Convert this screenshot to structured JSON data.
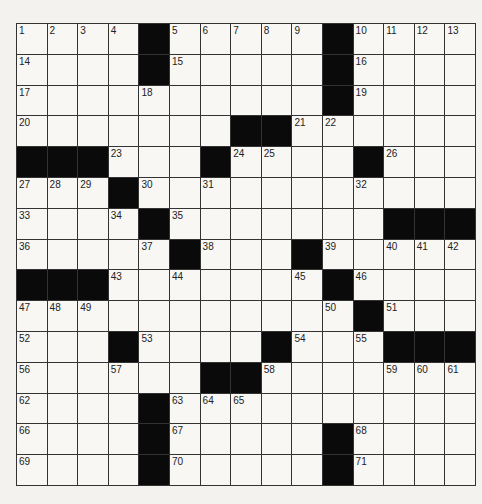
{
  "puzzle": {
    "rows": 15,
    "cols": 15,
    "colors": {
      "black": "#0a0a0a",
      "white": "#f8f7f4",
      "grid_line": "#333333"
    },
    "grid": [
      [
        "1",
        "2",
        "3",
        "4",
        "#",
        "5",
        "6",
        "7",
        "8",
        "9",
        "#",
        "10",
        "11",
        "12",
        "13"
      ],
      [
        "14",
        "",
        "",
        "",
        "#",
        "15",
        "",
        "",
        "",
        "",
        "#",
        "16",
        "",
        "",
        ""
      ],
      [
        "17",
        "",
        "",
        "",
        "18",
        "",
        "",
        "",
        "",
        "",
        "#",
        "19",
        "",
        "",
        ""
      ],
      [
        "20",
        "",
        "",
        "",
        "",
        "",
        "",
        "#",
        "#",
        "21",
        "22",
        "",
        "",
        "",
        ""
      ],
      [
        "#",
        "#",
        "#",
        "23",
        "",
        "",
        "#",
        "24",
        "25",
        "",
        "",
        "#",
        "26",
        "",
        ""
      ],
      [
        "27",
        "28",
        "29",
        "#",
        "30",
        "",
        "31",
        "",
        "",
        "",
        "",
        "32",
        "",
        "",
        ""
      ],
      [
        "33",
        "",
        "",
        "34",
        "#",
        "35",
        "",
        "",
        "",
        "",
        "",
        "",
        "#",
        "#",
        "#"
      ],
      [
        "36",
        "",
        "",
        "",
        "37",
        "#",
        "38",
        "",
        "",
        "#",
        "39",
        "",
        "40",
        "41",
        "42"
      ],
      [
        "#",
        "#",
        "#",
        "43",
        "",
        "44",
        "",
        "",
        "",
        "45",
        "#",
        "46",
        "",
        "",
        ""
      ],
      [
        "47",
        "48",
        "49",
        "",
        "",
        "",
        "",
        "",
        "",
        "",
        "50",
        "#",
        "51",
        "",
        ""
      ],
      [
        "52",
        "",
        "",
        "#",
        "53",
        "",
        "",
        "",
        "#",
        "54",
        "",
        "55",
        "#",
        "#",
        "#"
      ],
      [
        "56",
        "",
        "",
        "57",
        "",
        "",
        "#",
        "#",
        "58",
        "",
        "",
        "",
        "59",
        "60",
        "61"
      ],
      [
        "62",
        "",
        "",
        "",
        "#",
        "63",
        "64",
        "65",
        "",
        "",
        "",
        "",
        "",
        "",
        ""
      ],
      [
        "66",
        "",
        "",
        "",
        "#",
        "67",
        "",
        "",
        "",
        "",
        "#",
        "68",
        "",
        "",
        ""
      ],
      [
        "69",
        "",
        "",
        "",
        "#",
        "70",
        "",
        "",
        "",
        "",
        "#",
        "71",
        "",
        "",
        ""
      ]
    ]
  }
}
